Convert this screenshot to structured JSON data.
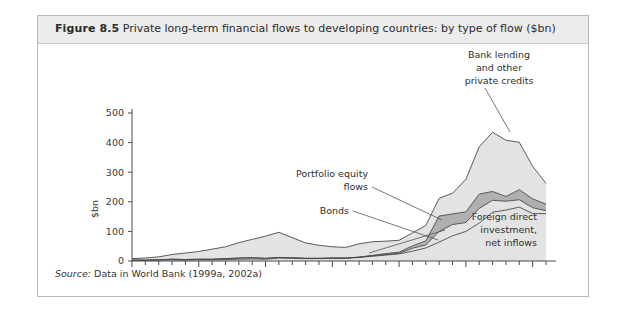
{
  "figure": {
    "number": "Figure 8.5",
    "title": "Private long-term financial flows to developing countries: by type of flow ($bn)",
    "source_label": "Source:",
    "source_text": " Data in World Bank (1999a, 2002a)"
  },
  "colors": {
    "frame_border": "#b9b9b9",
    "header_background": "#ececec",
    "band_light": "#e3e3e3",
    "band_medium": "#d8d8d8",
    "band_dark": "#b0b0b0",
    "line": "#4a4a4a",
    "text": "#2f2f2f"
  },
  "annotations": [
    {
      "name": "bank-lending",
      "lines": [
        "Bank lending",
        "and other",
        "private credits"
      ],
      "align": "middle"
    },
    {
      "name": "portfolio-equity",
      "lines": [
        "Portfolio equity",
        "flows"
      ],
      "align": "end"
    },
    {
      "name": "bonds",
      "lines": [
        "Bonds"
      ],
      "align": "end"
    },
    {
      "name": "fdi",
      "lines": [
        "Foreign direct",
        "investment,",
        "net inflows"
      ],
      "align": "end"
    }
  ],
  "chart_data": {
    "type": "area",
    "stacked": true,
    "title": "Private long-term financial flows to developing countries: by type of flow ($bn)",
    "xlabel": "",
    "ylabel": "$bn",
    "ylim": [
      0,
      500
    ],
    "yticks": [
      0,
      100,
      200,
      300,
      400,
      500
    ],
    "xlim": [
      1970,
      2001
    ],
    "xticks_labeled": [
      1970,
      1975,
      1980,
      1985,
      1990,
      1995,
      2000
    ],
    "xtick_every": 1,
    "grid": false,
    "legend": "annotated-inline",
    "x": [
      1970,
      1971,
      1972,
      1973,
      1974,
      1975,
      1976,
      1977,
      1978,
      1979,
      1980,
      1981,
      1982,
      1983,
      1984,
      1985,
      1986,
      1987,
      1988,
      1989,
      1990,
      1991,
      1992,
      1993,
      1994,
      1995,
      1996,
      1997,
      1998,
      1999,
      2000,
      2001
    ],
    "series": [
      {
        "name": "Foreign direct investment, net inflows",
        "color": "#e3e3e3",
        "values": [
          2,
          2,
          3,
          4,
          3,
          4,
          4,
          5,
          6,
          7,
          6,
          10,
          9,
          8,
          8,
          9,
          9,
          12,
          16,
          20,
          24,
          33,
          44,
          64,
          85,
          100,
          128,
          165,
          172,
          182,
          160,
          160
        ]
      },
      {
        "name": "Bonds",
        "color": "#e3e3e3",
        "values": [
          1,
          1,
          1,
          2,
          2,
          2,
          2,
          3,
          4,
          4,
          3,
          2,
          2,
          1,
          1,
          1,
          1,
          1,
          2,
          2,
          2,
          10,
          10,
          36,
          38,
          30,
          50,
          40,
          30,
          25,
          20,
          10
        ]
      },
      {
        "name": "Portfolio equity flows",
        "color": "#b0b0b0",
        "values": [
          0,
          0,
          0,
          0,
          0,
          0,
          0,
          0,
          0,
          0,
          0,
          0,
          0,
          0,
          0,
          0,
          0,
          0,
          1,
          3,
          4,
          8,
          14,
          52,
          36,
          36,
          48,
          30,
          16,
          34,
          30,
          22
        ]
      },
      {
        "name": "Bank lending and other private credits",
        "color": "#e3e3e3",
        "values": [
          5,
          7,
          10,
          16,
          22,
          26,
          34,
          40,
          52,
          62,
          75,
          85,
          68,
          52,
          44,
          38,
          36,
          45,
          46,
          42,
          40,
          44,
          52,
          60,
          70,
          110,
          160,
          200,
          190,
          160,
          110,
          70
        ]
      }
    ]
  }
}
